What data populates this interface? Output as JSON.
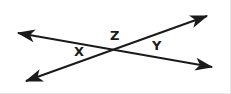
{
  "figure": {
    "background_color": "#ffffff",
    "stroke_color": "#1a1a1a",
    "stroke_width": 2,
    "canvas": {
      "width": 231,
      "height": 94
    },
    "intersection_point": {
      "x": 117,
      "y": 48
    },
    "lines": [
      {
        "name": "line-upper-left-to-lower-right",
        "from": {
          "x": 18,
          "y": 33
        },
        "to": {
          "x": 212,
          "y": 67
        },
        "arrow_start": true,
        "arrow_end": true
      },
      {
        "name": "line-lower-left-to-upper-right",
        "from": {
          "x": 26,
          "y": 81
        },
        "to": {
          "x": 207,
          "y": 16
        },
        "arrow_start": true,
        "arrow_end": true
      }
    ],
    "labels": [
      {
        "id": "z",
        "text": "Z",
        "x": 115,
        "y": 36,
        "position": "top-angle"
      },
      {
        "id": "x",
        "text": "X",
        "x": 79,
        "y": 52,
        "position": "left-angle"
      },
      {
        "id": "y",
        "text": "Y",
        "x": 157,
        "y": 46,
        "position": "right-angle"
      }
    ]
  }
}
